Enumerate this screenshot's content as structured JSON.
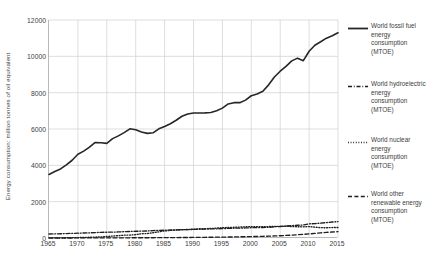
{
  "chart_data": {
    "type": "line",
    "title": "",
    "xlabel": "",
    "ylabel": "Energy consumption: million tonnes of oil equivalent",
    "xlim": [
      1965,
      2015
    ],
    "ylim": [
      0,
      12000
    ],
    "xticks": [
      "1965",
      "1970",
      "1975",
      "1980",
      "1985",
      "1990",
      "1995",
      "2000",
      "2005",
      "2010",
      "2015"
    ],
    "yticks": [
      "0",
      "2000",
      "4000",
      "6000",
      "8000",
      "10000",
      "12000"
    ],
    "grid": true,
    "legend_position": "right",
    "x": [
      1965,
      1966,
      1967,
      1968,
      1969,
      1970,
      1971,
      1972,
      1973,
      1974,
      1975,
      1976,
      1977,
      1978,
      1979,
      1980,
      1981,
      1982,
      1983,
      1984,
      1985,
      1986,
      1987,
      1988,
      1989,
      1990,
      1991,
      1992,
      1993,
      1994,
      1995,
      1996,
      1997,
      1998,
      1999,
      2000,
      2001,
      2002,
      2003,
      2004,
      2005,
      2006,
      2007,
      2008,
      2009,
      2010,
      2011,
      2012,
      2013,
      2014,
      2015
    ],
    "series": [
      {
        "name": "World fossil fuel energy consumption (MTOE)",
        "style": "solid",
        "color": "#262626",
        "values": [
          3500,
          3660,
          3800,
          4030,
          4280,
          4610,
          4780,
          5000,
          5260,
          5240,
          5210,
          5470,
          5620,
          5800,
          6010,
          5960,
          5840,
          5760,
          5790,
          6010,
          6140,
          6290,
          6480,
          6700,
          6830,
          6880,
          6880,
          6890,
          6910,
          7000,
          7150,
          7380,
          7450,
          7450,
          7590,
          7830,
          7930,
          8080,
          8430,
          8860,
          9180,
          9450,
          9750,
          9900,
          9760,
          10280,
          10610,
          10800,
          11000,
          11130,
          11300
        ]
      },
      {
        "name": "World hydroelectric energy consumption (MTOE)",
        "style": "dashdot",
        "color": "#1f1f1f",
        "values": [
          218,
          226,
          234,
          245,
          254,
          265,
          274,
          284,
          299,
          313,
          318,
          322,
          334,
          350,
          360,
          370,
          380,
          387,
          407,
          420,
          430,
          440,
          445,
          456,
          460,
          475,
          480,
          487,
          500,
          505,
          515,
          530,
          540,
          545,
          555,
          568,
          570,
          580,
          585,
          620,
          635,
          660,
          680,
          700,
          715,
          780,
          790,
          820,
          850,
          880,
          900
        ]
      },
      {
        "name": "World nuclear energy consumption (MTOE)",
        "style": "dotted",
        "color": "#1f1f1f",
        "values": [
          6,
          8,
          10,
          13,
          17,
          22,
          30,
          40,
          50,
          62,
          85,
          105,
          130,
          155,
          160,
          185,
          235,
          245,
          290,
          340,
          390,
          415,
          440,
          460,
          470,
          485,
          510,
          515,
          525,
          545,
          570,
          580,
          590,
          600,
          620,
          630,
          625,
          630,
          630,
          635,
          640,
          645,
          630,
          620,
          615,
          630,
          600,
          570,
          565,
          575,
          580
        ]
      },
      {
        "name": "World other renewable energy consumption (MTOE)",
        "style": "dashed",
        "color": "#1f1f1f",
        "values": [
          2,
          2,
          2,
          3,
          3,
          4,
          4,
          5,
          5,
          6,
          7,
          8,
          9,
          10,
          11,
          12,
          13,
          14,
          16,
          18,
          20,
          22,
          24,
          26,
          29,
          32,
          35,
          38,
          41,
          45,
          49,
          54,
          59,
          65,
          71,
          78,
          85,
          93,
          102,
          113,
          126,
          142,
          160,
          180,
          200,
          225,
          255,
          285,
          310,
          330,
          350
        ]
      }
    ]
  },
  "legend": {
    "items": [
      {
        "label": "World fossil fuel energy consumption (MTOE)",
        "marker": "solid-line-icon"
      },
      {
        "label": "World hydroelectric energy consumption (MTOE)",
        "marker": "dashdot-line-icon"
      },
      {
        "label": "World nuclear energy consumption (MTOE)",
        "marker": "dotted-line-icon"
      },
      {
        "label": "World other renewable energy consumption (MTOE)",
        "marker": "dashed-line-icon"
      }
    ]
  },
  "colors": {
    "line": "#262626",
    "grid": "#d0d0d0",
    "axis": "#b9b9b9",
    "text": "#404040",
    "background": "#ffffff"
  }
}
